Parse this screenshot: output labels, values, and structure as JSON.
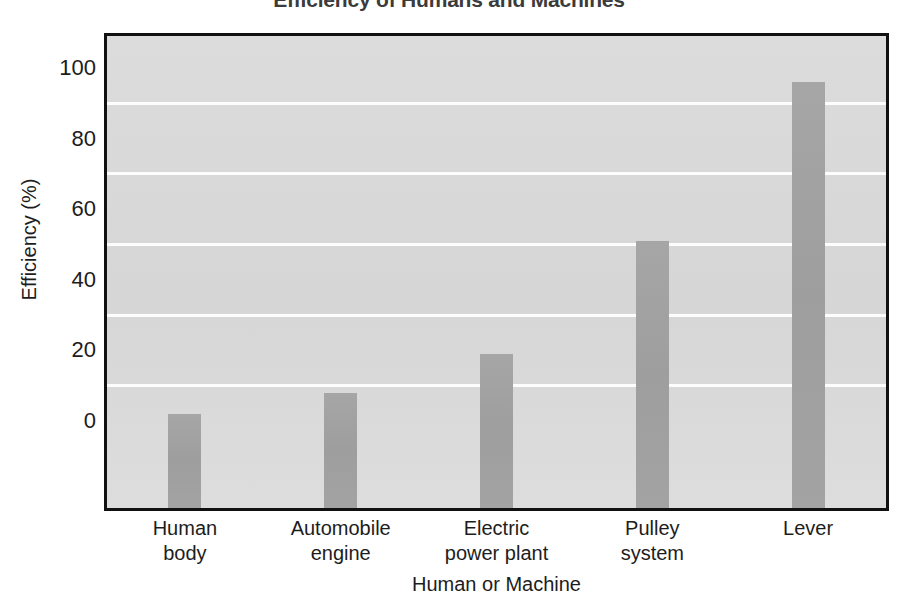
{
  "chart_data": {
    "type": "bar",
    "title": "Efficiency of Humans and Machines",
    "xlabel": "Human or Machine",
    "ylabel": "Efficiency (%)",
    "categories": [
      "Human body",
      "Automobile engine",
      "Electric power plant",
      "Pulley system",
      "Lever"
    ],
    "category_lines": [
      [
        "Human",
        "body"
      ],
      [
        "Automobile",
        "engine"
      ],
      [
        "Electric",
        "power plant"
      ],
      [
        "Pulley",
        "system"
      ],
      [
        "Lever"
      ]
    ],
    "values": [
      2,
      8,
      19,
      51,
      96
    ],
    "ylim": [
      0,
      100
    ],
    "yticks": [
      0,
      20,
      40,
      60,
      80,
      100
    ],
    "ytick_labels": [
      "0",
      "20",
      "40",
      "60",
      "80",
      "100"
    ],
    "gridlines_at": [
      10,
      30,
      50,
      70,
      90
    ],
    "grid": true,
    "legend": "none",
    "colors": {
      "bar": "#a0a0a0",
      "plot_background": "#d9d9d9",
      "gridline": "#ffffff",
      "axis_border": "#111111",
      "text": "#1d1d1d",
      "title_text": "#3b3b3b"
    }
  },
  "chart": {
    "title": "Efficiency of Humans and Machines",
    "y_axis_title": "Efficiency (%)",
    "x_axis_title": "Human or Machine"
  }
}
